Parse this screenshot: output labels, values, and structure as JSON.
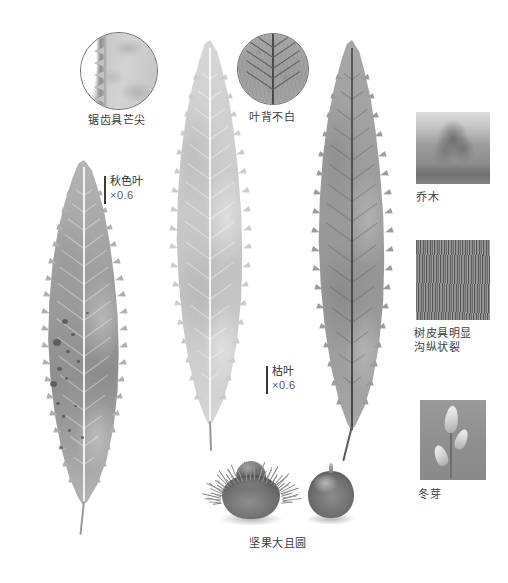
{
  "plate": {
    "width": 508,
    "height": 583,
    "background": "#ffffff"
  },
  "detail_circles": [
    {
      "id": "serrate-margin",
      "caption": "锯齿具芒尖",
      "x": 80,
      "y": 32,
      "size": 76,
      "caption_x": 117,
      "caption_y": 113
    },
    {
      "id": "leaf-underside",
      "caption": "叶背不白",
      "x": 237,
      "y": 33,
      "size": 70,
      "caption_x": 272,
      "caption_y": 110
    }
  ],
  "leaves": [
    {
      "id": "autumn-leaf",
      "name": "autumn-color-leaf",
      "scale_label": "秋色叶",
      "magnification": "×0.6",
      "x": 28,
      "y": 160,
      "width": 112,
      "height": 345,
      "tone_top": "#b6b6b6",
      "tone_bottom": "#8d8d8d",
      "midrib_color": "#f2f2f2",
      "has_spots": true
    },
    {
      "id": "green-leaf",
      "name": "mature-green-leaf",
      "scale_label": "",
      "magnification": "",
      "x": 158,
      "y": 40,
      "width": 104,
      "height": 385,
      "tone_top": "#d8d8d8",
      "tone_bottom": "#c2c2c2",
      "midrib_color": "#fafafa",
      "has_spots": false
    },
    {
      "id": "withered-leaf",
      "name": "withered-leaf",
      "scale_label": "枯叶",
      "magnification": "×0.6",
      "x": 300,
      "y": 40,
      "width": 104,
      "height": 390,
      "tone_top": "#a8a8a8",
      "tone_bottom": "#959595",
      "midrib_color": "#4a4a4a",
      "has_spots": false
    }
  ],
  "scale_bars": [
    {
      "for": "autumn-leaf",
      "label": "秋色叶",
      "magnification": "×0.6",
      "bar_x": 104,
      "bar_y": 176,
      "bar_height": 28,
      "text_x": 110,
      "text_y": 174
    },
    {
      "for": "withered-leaf",
      "label": "枯叶",
      "magnification": "×0.6",
      "bar_x": 266,
      "bar_y": 366,
      "bar_height": 28,
      "text_x": 272,
      "text_y": 364
    }
  ],
  "fruit": {
    "caption": "坚果大且圆",
    "caption_x": 278,
    "caption_y": 536,
    "burr": {
      "x": 216,
      "y": 459,
      "width": 70,
      "height": 62
    },
    "nut": {
      "x": 308,
      "y": 462,
      "width": 46,
      "height": 58
    }
  },
  "side_panels": [
    {
      "id": "habit",
      "caption": "乔木",
      "x": 416,
      "y": 112,
      "width": 74,
      "height": 72,
      "caption_x": 416,
      "caption_y": 190
    },
    {
      "id": "bark",
      "caption_line1": "树皮具明显",
      "caption_line2": "沟纵状裂",
      "x": 416,
      "y": 240,
      "width": 74,
      "height": 80,
      "caption_x": 414,
      "caption_y": 326
    },
    {
      "id": "winter-bud",
      "caption": "冬芽",
      "x": 420,
      "y": 400,
      "width": 66,
      "height": 80,
      "caption_x": 418,
      "caption_y": 487
    }
  ],
  "colors": {
    "ink": "#3d3d3d",
    "rule": "#6d6d6d",
    "paper": "#ffffff"
  }
}
